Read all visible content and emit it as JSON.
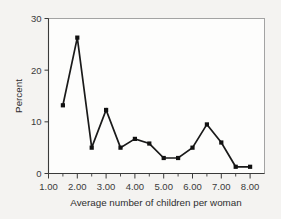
{
  "chart_data": {
    "type": "line",
    "title": "",
    "xlabel": "Average number of children per woman",
    "ylabel": "Percent",
    "xlim": [
      1.0,
      8.5
    ],
    "ylim": [
      0,
      30
    ],
    "grid": false,
    "legend": null,
    "x": [
      1.5,
      2.0,
      2.5,
      3.0,
      3.5,
      4.0,
      4.5,
      5.0,
      5.5,
      6.0,
      6.5,
      7.0,
      7.5,
      8.0
    ],
    "values": [
      13.2,
      26.3,
      5.0,
      12.3,
      5.0,
      6.7,
      5.8,
      3.0,
      3.0,
      5.0,
      9.5,
      6.0,
      1.3,
      1.3
    ],
    "series": [
      {
        "name": "Percent",
        "values": [
          13.2,
          26.3,
          5.0,
          12.3,
          5.0,
          6.7,
          5.8,
          3.0,
          3.0,
          5.0,
          9.5,
          6.0,
          1.3,
          1.3
        ]
      }
    ],
    "x_tick_labels": [
      "1.00",
      "2.00",
      "3.00",
      "4.00",
      "5.00",
      "6.00",
      "7.00",
      "8.00"
    ],
    "x_tick_values": [
      1.0,
      2.0,
      3.0,
      4.0,
      5.0,
      6.0,
      7.0,
      8.0
    ],
    "x_minor_tick_values": [
      1.5,
      2.5,
      3.5,
      4.5,
      5.5,
      6.5,
      7.5
    ],
    "y_tick_labels": [
      "0",
      "10",
      "20",
      "30"
    ],
    "y_tick_values": [
      0,
      10,
      20,
      30
    ],
    "marker": "filled-square",
    "line_color": "#111111",
    "background_color": "#f4f3f1",
    "plot_background_color": "#fdfdfc"
  },
  "axis": {
    "y_title": "Percent",
    "x_title": "Average number of children per woman"
  }
}
